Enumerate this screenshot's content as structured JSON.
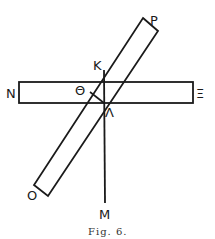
{
  "figure": {
    "caption": "Fig. 6.",
    "labels": {
      "P": "P",
      "K": "K",
      "N": "N",
      "Theta": "Θ",
      "Xi": "Ξ",
      "Lambda": "Λ",
      "O": "O",
      "M": "M"
    },
    "colors": {
      "stroke": "#1a1a1a",
      "background": "#ffffff"
    }
  }
}
